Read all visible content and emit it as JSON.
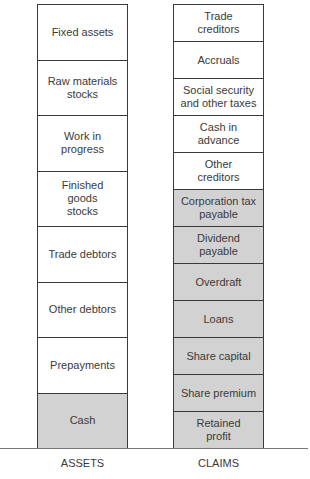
{
  "diagram": {
    "type": "balance-sheet-columns",
    "colors": {
      "border": "#3a3a3a",
      "shaded": "#d2d2d2",
      "unshaded": "#ffffff",
      "baseline": "#777777"
    },
    "assets": {
      "label": "ASSETS",
      "items": [
        {
          "label": "Fixed assets",
          "shaded": false
        },
        {
          "label": "Raw materials\nstocks",
          "shaded": false
        },
        {
          "label": "Work in\nprogress",
          "shaded": false
        },
        {
          "label": "Finished\ngoods\nstocks",
          "shaded": false
        },
        {
          "label": "Trade debtors",
          "shaded": false
        },
        {
          "label": "Other debtors",
          "shaded": false
        },
        {
          "label": "Prepayments",
          "shaded": false
        },
        {
          "label": "Cash",
          "shaded": true
        }
      ]
    },
    "claims": {
      "label": "CLAIMS",
      "items": [
        {
          "label": "Trade\ncreditors",
          "shaded": false
        },
        {
          "label": "Accruals",
          "shaded": false
        },
        {
          "label": "Social security\nand other taxes",
          "shaded": false
        },
        {
          "label": "Cash in\nadvance",
          "shaded": false
        },
        {
          "label": "Other\ncreditors",
          "shaded": false
        },
        {
          "label": "Corporation tax\npayable",
          "shaded": true
        },
        {
          "label": "Dividend\npayable",
          "shaded": true
        },
        {
          "label": "Overdraft",
          "shaded": true
        },
        {
          "label": "Loans",
          "shaded": true
        },
        {
          "label": "Share capital",
          "shaded": true
        },
        {
          "label": "Share premium",
          "shaded": true
        },
        {
          "label": "Retained\nprofit",
          "shaded": true
        }
      ]
    }
  }
}
